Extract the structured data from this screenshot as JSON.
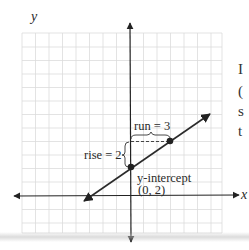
{
  "figure": {
    "axis_labels": {
      "y": "y",
      "x": "x"
    },
    "annotations": {
      "run": "run = 3",
      "rise": "rise = 2",
      "intercept_label": "y-intercept",
      "intercept_coords": "(0, 2)"
    },
    "line": {
      "slope": "2/3",
      "y_intercept": 2,
      "points": [
        [
          0,
          2
        ],
        [
          3,
          4
        ]
      ]
    },
    "colors": {
      "grid": "#d9d9d9",
      "axis": "#222222",
      "line": "#2b2b2b",
      "text": "#2a2a2a"
    }
  },
  "edge_text": [
    "I",
    "(",
    "s",
    "t"
  ]
}
